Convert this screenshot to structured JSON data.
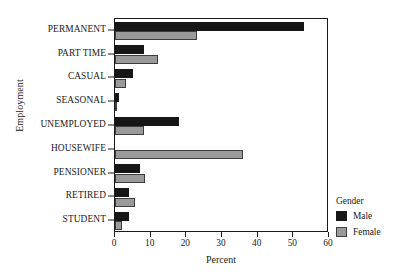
{
  "chart_data": {
    "type": "bar",
    "orientation": "horizontal",
    "title": "",
    "xlabel": "Percent",
    "ylabel": "Employment",
    "xlim": [
      0,
      60
    ],
    "xticks": [
      0,
      10,
      20,
      30,
      40,
      50,
      60
    ],
    "grid": false,
    "categories": [
      "PERMANENT",
      "PART TIME",
      "CASUAL",
      "SEASONAL",
      "UNEMPLOYED",
      "HOUSEWIFE",
      "PENSIONER",
      "RETIRED",
      "STUDENT"
    ],
    "series": [
      {
        "name": "Male",
        "color": "#161616",
        "values": [
          53,
          8,
          5,
          1,
          18,
          0,
          7,
          4,
          4
        ]
      },
      {
        "name": "Female",
        "color": "#9a9a9a",
        "values": [
          23,
          12,
          3,
          0.5,
          8,
          36,
          8.5,
          5.5,
          2
        ]
      }
    ],
    "legend": {
      "title": "Gender",
      "position": "right",
      "entries": [
        {
          "label": "Male",
          "color": "#161616"
        },
        {
          "label": "Female",
          "color": "#9a9a9a"
        }
      ]
    }
  }
}
